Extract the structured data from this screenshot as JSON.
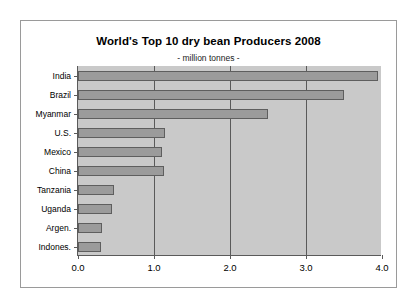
{
  "chart_data": {
    "type": "bar",
    "orientation": "horizontal",
    "title": "World's Top 10 dry bean Producers 2008",
    "subtitle": "- million tonnes -",
    "xlabel": "",
    "ylabel": "",
    "xlim": [
      0.0,
      4.0
    ],
    "xticks": [
      "0.0",
      "1.0",
      "2.0",
      "3.0",
      "4.0"
    ],
    "xtick_values": [
      0.0,
      1.0,
      2.0,
      3.0,
      4.0
    ],
    "grid": "vertical",
    "legend": "none",
    "categories": [
      "India",
      "Brazil",
      "Myanmar",
      "U.S.",
      "Mexico",
      "China",
      "Tanzania",
      "Uganda",
      "Argen.",
      "Indones."
    ],
    "values": [
      3.95,
      3.5,
      2.5,
      1.15,
      1.1,
      1.13,
      0.48,
      0.45,
      0.32,
      0.3
    ],
    "colors": {
      "bar_fill": "#9b9b9b",
      "bar_border": "#5e5e5e",
      "plot_background": "#c9c9c9",
      "gridline": "#5a5a5a",
      "axis": "#5a5a5a",
      "frame_border": "#9a9a9a",
      "page_background": "#ffffff",
      "text": "#000000"
    }
  }
}
